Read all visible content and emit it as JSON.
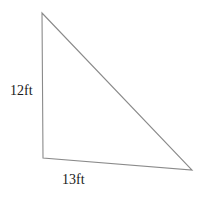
{
  "figure": {
    "type": "right-triangle-diagram",
    "background_color": "#ffffff",
    "stroke_color": "#8a8a8a",
    "text_color": "#1a1a1a",
    "labels": {
      "vertical_leg": "12ft",
      "horizontal_leg": "13ft"
    },
    "geometry": {
      "top_vertex": {
        "x": 42,
        "y": 13
      },
      "bottom_left_vertex": {
        "x": 43,
        "y": 158
      },
      "bottom_right_vertex": {
        "x": 192,
        "y": 170
      },
      "vertical_leg_length_text": "12ft",
      "horizontal_leg_length_text": "13ft",
      "points_attr": "42,13 43,158 192,170"
    }
  }
}
